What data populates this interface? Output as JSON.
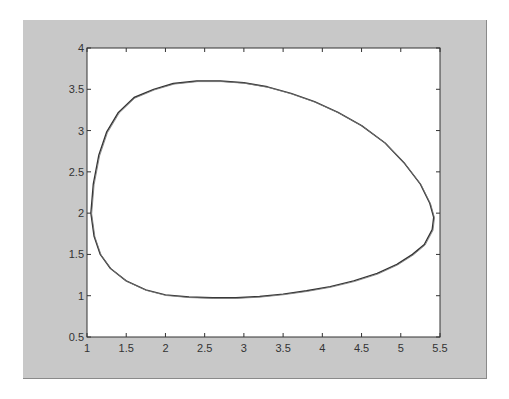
{
  "chart_data": {
    "type": "line",
    "title": "",
    "xlabel": "",
    "ylabel": "",
    "xlim": [
      1,
      5.5
    ],
    "ylim": [
      0.5,
      4
    ],
    "grid": false,
    "legend": null,
    "xticks": [
      "1",
      "1.5",
      "2",
      "2.5",
      "3",
      "3.5",
      "4",
      "4.5",
      "5",
      "5.5"
    ],
    "yticks": [
      "0.5",
      "1",
      "1.5",
      "2",
      "2.5",
      "3",
      "3.5",
      "4"
    ],
    "series": [
      {
        "name": "closed orbit (limit cycle)",
        "color": "#333333",
        "x": [
          1.05,
          1.08,
          1.15,
          1.25,
          1.4,
          1.6,
          1.85,
          2.1,
          2.4,
          2.7,
          3.0,
          3.3,
          3.6,
          3.9,
          4.2,
          4.5,
          4.8,
          5.05,
          5.25,
          5.37,
          5.42,
          5.4,
          5.3,
          5.15,
          4.95,
          4.7,
          4.4,
          4.1,
          3.8,
          3.5,
          3.2,
          2.9,
          2.6,
          2.3,
          2.0,
          1.75,
          1.5,
          1.3,
          1.17,
          1.09,
          1.05
        ],
        "y": [
          2.0,
          2.35,
          2.7,
          2.98,
          3.22,
          3.4,
          3.5,
          3.57,
          3.6,
          3.6,
          3.58,
          3.53,
          3.45,
          3.35,
          3.22,
          3.06,
          2.85,
          2.6,
          2.35,
          2.12,
          1.95,
          1.8,
          1.62,
          1.5,
          1.38,
          1.27,
          1.18,
          1.11,
          1.06,
          1.02,
          0.99,
          0.975,
          0.975,
          0.985,
          1.01,
          1.07,
          1.18,
          1.33,
          1.5,
          1.72,
          2.0
        ]
      }
    ]
  },
  "figure": {
    "background": "#c8c8c8",
    "axes_background": "#ffffff"
  }
}
